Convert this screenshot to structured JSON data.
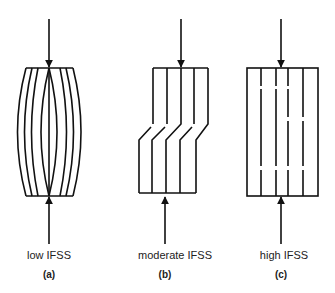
{
  "panels": [
    {
      "id": "a",
      "caption": "low IFSS",
      "tag": "(a)",
      "failure_mode": "fiber buckling / bulging"
    },
    {
      "id": "b",
      "caption": "moderate IFSS",
      "tag": "(b)",
      "failure_mode": "kink / shear band"
    },
    {
      "id": "c",
      "caption": "high IFSS",
      "tag": "(c)",
      "failure_mode": "fiber breaks"
    }
  ],
  "colors": {
    "stroke": "#111111",
    "background": "#ffffff"
  }
}
